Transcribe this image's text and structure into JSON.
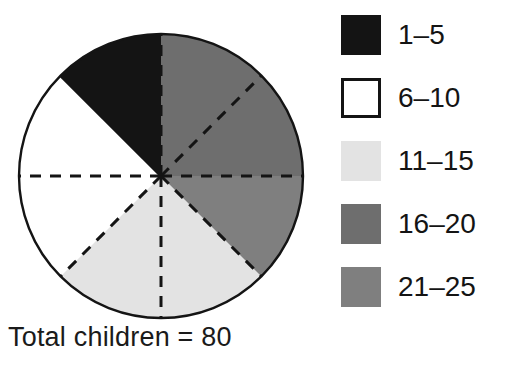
{
  "figure": {
    "caption": "Total children = 80",
    "total": 80
  },
  "legend": {
    "items": [
      {
        "label": "1–5",
        "color": "#141414",
        "border": "none"
      },
      {
        "label": "6–10",
        "color": "#ffffff",
        "border": "#141414"
      },
      {
        "label": "11–15",
        "color": "#e3e3e3",
        "border": "none"
      },
      {
        "label": "16–20",
        "color": "#6e6e6e",
        "border": "none"
      },
      {
        "label": "21–25",
        "color": "#7f7f7f",
        "border": "none"
      }
    ]
  },
  "pie": {
    "center_x": 161,
    "center_y": 176,
    "radius": 142,
    "outline_color": "#141414",
    "divider_color": "#141414",
    "divider_style": "dashed",
    "eighth_degrees": 45
  },
  "chart_data": {
    "type": "pie",
    "title": "",
    "caption": "Total children = 80",
    "total": 80,
    "unit": "children",
    "legend_position": "right",
    "categories": [
      "1–5",
      "6–10",
      "11–15",
      "16–20",
      "21–25"
    ],
    "values": [
      10,
      20,
      20,
      20,
      10
    ],
    "fractions": [
      "1/8",
      "2/8",
      "2/8",
      "2/8",
      "1/8"
    ],
    "percentages": [
      12.5,
      25,
      25,
      25,
      12.5
    ],
    "angles_deg": [
      45,
      90,
      90,
      90,
      45
    ],
    "colors": [
      "#141414",
      "#ffffff",
      "#e3e3e3",
      "#6e6e6e",
      "#7f7f7f"
    ],
    "slices": [
      {
        "label": "1–5",
        "value": 10,
        "start_deg": 90,
        "end_deg": 135,
        "color": "#141414"
      },
      {
        "label": "6–10",
        "value": 20,
        "start_deg": 135,
        "end_deg": 225,
        "color": "#ffffff"
      },
      {
        "label": "11–15",
        "value": 20,
        "start_deg": 225,
        "end_deg": 315,
        "color": "#e3e3e3"
      },
      {
        "label": "21–25",
        "value": 10,
        "start_deg": 315,
        "end_deg": 360,
        "color": "#7f7f7f"
      },
      {
        "label": "16–20",
        "value": 20,
        "start_deg": 0,
        "end_deg": 90,
        "color": "#6e6e6e"
      }
    ]
  }
}
